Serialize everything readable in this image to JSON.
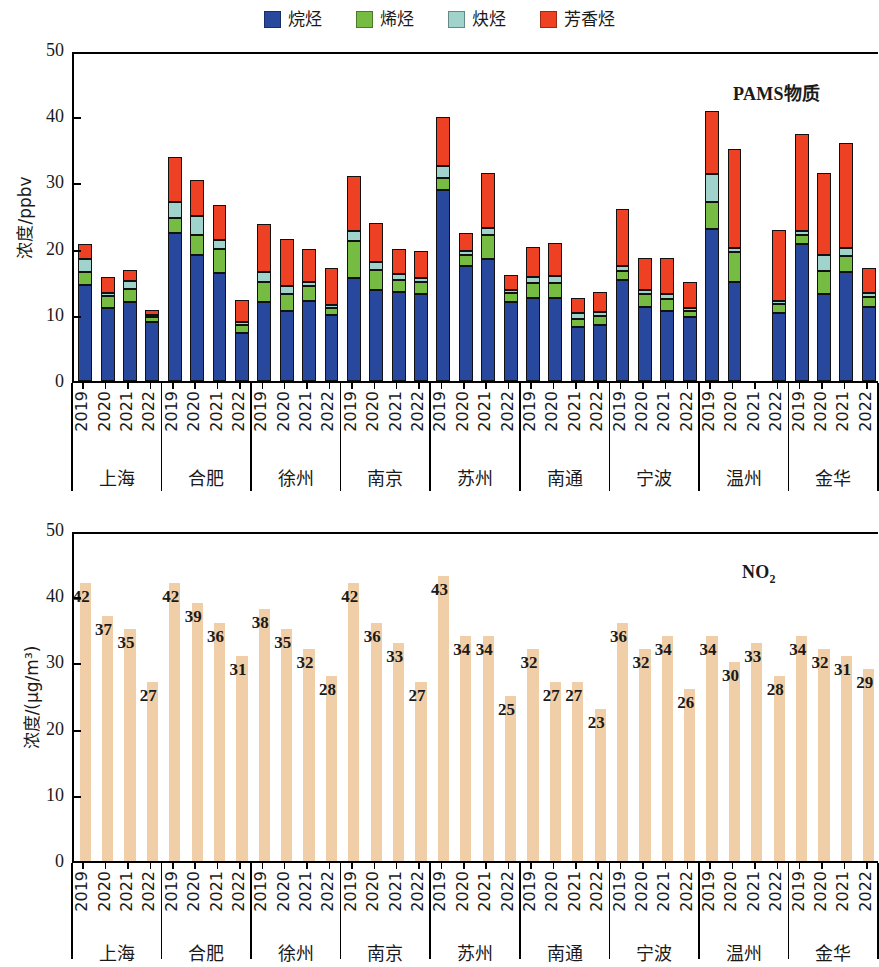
{
  "legend": {
    "items": [
      {
        "label": "烷烃",
        "color": "#27489c"
      },
      {
        "label": "烯烃",
        "color": "#76bc43"
      },
      {
        "label": "炔烃",
        "color": "#9fd3cb"
      },
      {
        "label": "芳香烃",
        "color": "#ee4022"
      }
    ]
  },
  "cities": [
    "上海",
    "合肥",
    "徐州",
    "南京",
    "苏州",
    "南通",
    "宁波",
    "温州",
    "金华"
  ],
  "years": [
    "2019",
    "2020",
    "2021",
    "2022"
  ],
  "panels": {
    "top": {
      "annotation": "PAMS物质",
      "ylabel": "浓度/ppbv",
      "yticks": [
        "0",
        "10",
        "20",
        "30",
        "40",
        "50"
      ]
    },
    "bottom": {
      "annotation_main": "NO",
      "annotation_sub": "2",
      "ylabel": "浓度/(μg/m³)",
      "yticks": [
        "0",
        "10",
        "20",
        "30",
        "40",
        "50"
      ]
    }
  },
  "chart_data": [
    {
      "type": "bar",
      "stacked": true,
      "title": "PAMS物质",
      "xlabel": "",
      "ylabel": "浓度/ppbv",
      "ylim": [
        0,
        50
      ],
      "yticks": [
        0,
        10,
        20,
        30,
        40,
        50
      ],
      "grid": false,
      "legend_position": "top-center",
      "categories": [
        "上海 2019",
        "上海 2020",
        "上海 2021",
        "上海 2022",
        "合肥 2019",
        "合肥 2020",
        "合肥 2021",
        "合肥 2022",
        "徐州 2019",
        "徐州 2020",
        "徐州 2021",
        "徐州 2022",
        "南京 2019",
        "南京 2020",
        "南京 2021",
        "南京 2022",
        "苏州 2019",
        "苏州 2020",
        "苏州 2021",
        "苏州 2022",
        "南通 2019",
        "南通 2020",
        "南通 2021",
        "南通 2022",
        "宁波 2019",
        "宁波 2020",
        "宁波 2021",
        "宁波 2022",
        "温州 2019",
        "温州 2020",
        "温州 2021",
        "温州 2022",
        "金华 2019",
        "金华 2020",
        "金华 2021",
        "金华 2022"
      ],
      "series": [
        {
          "name": "烷烃",
          "color": "#27489c",
          "values": [
            14.5,
            11.1,
            12.0,
            8.9,
            22.3,
            19.0,
            16.3,
            7.2,
            12.0,
            10.6,
            12.1,
            9.9,
            15.5,
            13.7,
            13.4,
            13.2,
            28.9,
            17.4,
            18.5,
            12.0,
            12.5,
            12.6,
            8.2,
            8.5,
            15.3,
            11.2,
            10.6,
            9.6,
            23.0,
            15.0,
            null,
            10.2,
            20.7,
            13.2,
            16.5,
            11.2
          ]
        },
        {
          "name": "烯烃",
          "color": "#76bc43",
          "values": [
            2.0,
            1.7,
            1.9,
            0.8,
            2.4,
            3.1,
            3.7,
            1.2,
            2.9,
            2.6,
            2.2,
            1.2,
            5.6,
            3.1,
            1.9,
            1.8,
            1.7,
            1.7,
            3.6,
            1.3,
            2.3,
            2.2,
            1.2,
            1.3,
            1.3,
            1.9,
            1.8,
            1.0,
            4.0,
            4.5,
            null,
            1.4,
            1.4,
            3.4,
            2.4,
            1.5
          ]
        },
        {
          "name": "炔烃",
          "color": "#9fd3cb",
          "values": [
            1.9,
            0.5,
            1.2,
            0.3,
            2.4,
            2.8,
            1.3,
            0.5,
            1.6,
            1.2,
            0.7,
            0.4,
            1.5,
            1.2,
            0.9,
            0.6,
            1.9,
            0.5,
            1.0,
            0.5,
            0.9,
            1.0,
            0.9,
            0.7,
            0.8,
            0.7,
            0.7,
            0.5,
            4.2,
            0.6,
            null,
            0.5,
            0.6,
            2.5,
            1.2,
            0.6
          ]
        },
        {
          "name": "芳香烃",
          "color": "#ee4022",
          "values": [
            2.3,
            2.4,
            1.6,
            0.7,
            6.7,
            5.5,
            5.3,
            3.4,
            7.2,
            7.1,
            4.9,
            5.5,
            8.3,
            5.9,
            3.7,
            4.0,
            7.4,
            2.8,
            8.3,
            2.2,
            4.6,
            5.0,
            2.3,
            3.0,
            8.6,
            4.8,
            5.5,
            3.8,
            9.6,
            15.0,
            null,
            10.7,
            14.6,
            12.3,
            15.9,
            3.8
          ]
        }
      ]
    },
    {
      "type": "bar",
      "stacked": false,
      "title": "NO2",
      "xlabel": "",
      "ylabel": "浓度/(μg/m³)",
      "ylim": [
        0,
        50
      ],
      "yticks": [
        0,
        10,
        20,
        30,
        40,
        50
      ],
      "grid": false,
      "bar_color": "#f0cfa8",
      "categories": [
        "上海 2019",
        "上海 2020",
        "上海 2021",
        "上海 2022",
        "合肥 2019",
        "合肥 2020",
        "合肥 2021",
        "合肥 2022",
        "徐州 2019",
        "徐州 2020",
        "徐州 2021",
        "徐州 2022",
        "南京 2019",
        "南京 2020",
        "南京 2021",
        "南京 2022",
        "苏州 2019",
        "苏州 2020",
        "苏州 2021",
        "苏州 2022",
        "南通 2019",
        "南通 2020",
        "南通 2021",
        "南通 2022",
        "宁波 2019",
        "宁波 2020",
        "宁波 2021",
        "宁波 2022",
        "温州 2019",
        "温州 2020",
        "温州 2021",
        "温州 2022",
        "金华 2019",
        "金华 2020",
        "金华 2021",
        "金华 2022"
      ],
      "values": [
        42,
        37,
        35,
        27,
        42,
        39,
        36,
        31,
        38,
        35,
        32,
        28,
        42,
        36,
        33,
        27,
        43,
        34,
        34,
        25,
        32,
        27,
        27,
        23,
        36,
        32,
        34,
        26,
        34,
        30,
        33,
        28,
        34,
        32,
        31,
        29
      ],
      "data_labels": [
        "42",
        "37",
        "35",
        "27",
        "42",
        "39",
        "36",
        "31",
        "38",
        "35",
        "32",
        "28",
        "42",
        "36",
        "33",
        "27",
        "43",
        "34",
        "34",
        "25",
        "32",
        "27",
        "27",
        "23",
        "36",
        "32",
        "34",
        "26",
        "34",
        "30",
        "33",
        "28",
        "34",
        "32",
        "31",
        "29"
      ]
    }
  ]
}
